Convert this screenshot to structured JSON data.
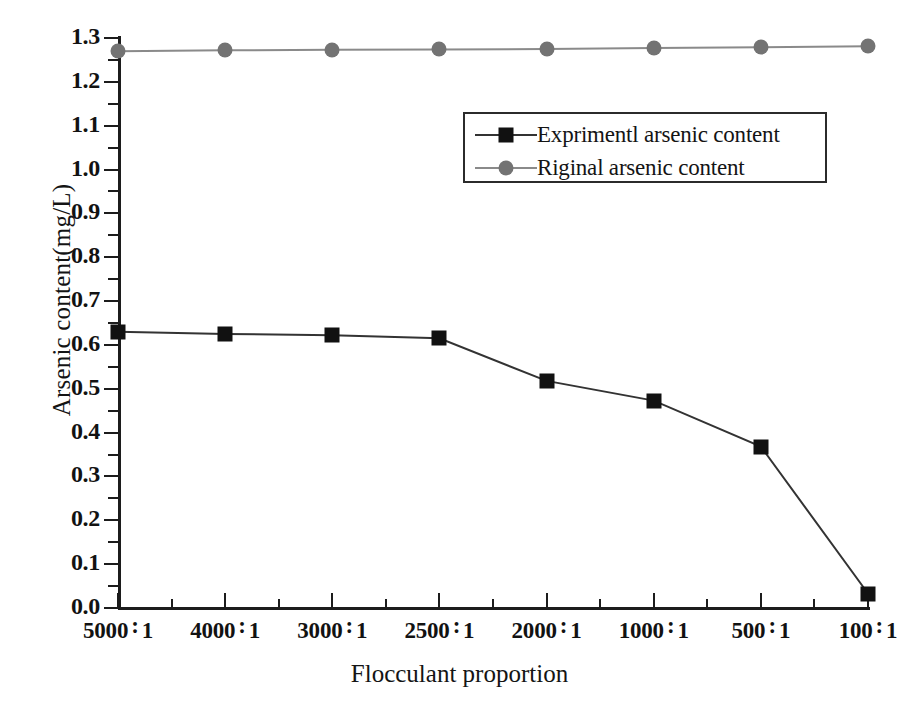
{
  "chart_data": {
    "type": "line",
    "title": "",
    "xlabel": "Flocculant proportion",
    "ylabel": "Arsenic content(mg/L)",
    "categories": [
      "5000 : 1",
      "4000 : 1",
      "3000 : 1",
      "2500 : 1",
      "2000 : 1",
      "1000 : 1",
      "500 : 1",
      "100 : 1"
    ],
    "category_parts": [
      {
        "left": "5000",
        "sep": ":",
        "right": "1"
      },
      {
        "left": "4000",
        "sep": ":",
        "right": "1"
      },
      {
        "left": "3000",
        "sep": ":",
        "right": "1"
      },
      {
        "left": "2500",
        "sep": ":",
        "right": "1"
      },
      {
        "left": "2000",
        "sep": ":",
        "right": "1"
      },
      {
        "left": "1000",
        "sep": ":",
        "right": "1"
      },
      {
        "left": "500",
        "sep": ":",
        "right": "1"
      },
      {
        "left": "100",
        "sep": ":",
        "right": "1"
      }
    ],
    "series": [
      {
        "name": "Exprimentl arsenic content",
        "marker": "square",
        "color": "#111111",
        "line_color": "#333333",
        "values": [
          0.63,
          0.625,
          0.622,
          0.615,
          0.518,
          0.473,
          0.368,
          0.033
        ]
      },
      {
        "name": "Riginal arsenic content",
        "marker": "circle",
        "color": "#737373",
        "line_color": "#8a8a8a",
        "values": [
          1.27,
          1.272,
          1.273,
          1.274,
          1.275,
          1.277,
          1.279,
          1.281
        ]
      }
    ],
    "ylim": [
      0.0,
      1.3
    ],
    "ytick_labels": [
      "0.0",
      "0.1",
      "0.2",
      "0.3",
      "0.4",
      "0.5",
      "0.6",
      "0.7",
      "0.8",
      "0.9",
      "1.0",
      "1.1",
      "1.2",
      "1.3"
    ],
    "ytick_values": [
      0.0,
      0.1,
      0.2,
      0.3,
      0.4,
      0.5,
      0.6,
      0.7,
      0.8,
      0.9,
      1.0,
      1.1,
      1.2,
      1.3
    ],
    "yminor_step": 0.05,
    "grid": false,
    "legend_position": "upper-center"
  },
  "legend": {
    "entries": [
      {
        "label": "Exprimentl arsenic content"
      },
      {
        "label": "Riginal arsenic content"
      }
    ]
  },
  "colors": {
    "axis": "#1c1c1c",
    "experimental": "#111111",
    "original": "#737373",
    "background": "#ffffff"
  }
}
